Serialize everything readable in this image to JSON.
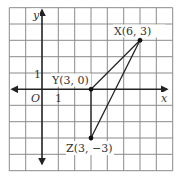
{
  "diagram": {
    "type": "coordinate-plane-triangle",
    "grid": {
      "x_min": -2,
      "x_max": 8,
      "y_min": -5,
      "y_max": 5,
      "grid_lines": true
    },
    "axes": {
      "x_label": "x",
      "y_label": "y",
      "origin_label": "O",
      "x_tick_label": "1",
      "y_tick_label": "1"
    },
    "points": [
      {
        "name": "X",
        "x": 6,
        "y": 3,
        "label": "X(6, 3)"
      },
      {
        "name": "Y",
        "x": 3,
        "y": 0,
        "label": "Y(3, 0)"
      },
      {
        "name": "Z",
        "x": 3,
        "y": -3,
        "label": "Z(3, −3)"
      }
    ],
    "segments": [
      [
        "X",
        "Y"
      ],
      [
        "Y",
        "Z"
      ],
      [
        "Z",
        "X"
      ]
    ],
    "colors": {
      "grid": "#8a8a8a",
      "axes": "#222222",
      "lines": "#222222",
      "text": "#333333"
    }
  }
}
